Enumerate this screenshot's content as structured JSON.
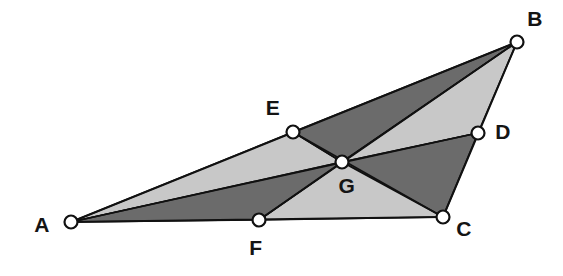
{
  "figure": {
    "kind": "geometry-diagram",
    "width": 563,
    "height": 276,
    "background_color": "#ffffff",
    "outline_color": "#111111",
    "shade_dark_color": "#6b6b6b",
    "shade_light_color": "#c8c8c8",
    "marker_fill_color": "#ffffff",
    "label_color": "#141414"
  },
  "points": [
    {
      "id": "A",
      "label": "A",
      "x": 71,
      "y": 222,
      "label_x": 42,
      "label_y": 224,
      "role": "triangle-vertex"
    },
    {
      "id": "B",
      "label": "B",
      "x": 517,
      "y": 42,
      "label_x": 535,
      "label_y": 18,
      "role": "triangle-vertex"
    },
    {
      "id": "C",
      "label": "C",
      "x": 443,
      "y": 217,
      "label_x": 464,
      "label_y": 228,
      "role": "triangle-vertex"
    },
    {
      "id": "D",
      "label": "D",
      "x": 478,
      "y": 133,
      "label_x": 503,
      "label_y": 131,
      "role": "side-point-on-BC"
    },
    {
      "id": "E",
      "label": "E",
      "x": 293,
      "y": 132,
      "label_x": 273,
      "label_y": 107,
      "role": "side-point-on-AB"
    },
    {
      "id": "F",
      "label": "F",
      "x": 259,
      "y": 220,
      "label_x": 256,
      "label_y": 247,
      "role": "side-point-on-AC"
    },
    {
      "id": "G",
      "label": "G",
      "x": 342,
      "y": 162,
      "label_x": 347,
      "label_y": 185,
      "role": "cevian-intersection"
    }
  ],
  "regions": [
    {
      "id": "AEG",
      "name": "region-a-e-g",
      "vertices": [
        "A",
        "E",
        "G"
      ],
      "shade": "light",
      "fill": "#c8c8c8"
    },
    {
      "id": "EBG",
      "name": "region-e-b-g",
      "vertices": [
        "E",
        "B",
        "G"
      ],
      "shade": "dark",
      "fill": "#6b6b6b"
    },
    {
      "id": "GBD",
      "name": "region-g-b-d",
      "vertices": [
        "G",
        "B",
        "D"
      ],
      "shade": "light",
      "fill": "#c8c8c8"
    },
    {
      "id": "GDC",
      "name": "region-g-d-c",
      "vertices": [
        "G",
        "D",
        "C"
      ],
      "shade": "dark",
      "fill": "#6b6b6b"
    },
    {
      "id": "GCF",
      "name": "region-g-c-f",
      "vertices": [
        "G",
        "C",
        "F"
      ],
      "shade": "light",
      "fill": "#c8c8c8"
    },
    {
      "id": "AGF",
      "name": "region-a-g-f",
      "vertices": [
        "A",
        "G",
        "F"
      ],
      "shade": "dark",
      "fill": "#6b6b6b"
    }
  ],
  "edges": [
    {
      "id": "AB",
      "name": "side-a-b",
      "from": "A",
      "to": "B",
      "kind": "triangle-side"
    },
    {
      "id": "BC",
      "name": "side-b-c",
      "from": "B",
      "to": "C",
      "kind": "triangle-side"
    },
    {
      "id": "CA",
      "name": "side-c-a",
      "from": "C",
      "to": "A",
      "kind": "triangle-side"
    }
  ],
  "cevians": [
    {
      "id": "AD",
      "name": "cevian-a-d",
      "from": "A",
      "to": "D"
    },
    {
      "id": "BF",
      "name": "cevian-b-f",
      "from": "B",
      "to": "F"
    },
    {
      "id": "CE",
      "name": "cevian-c-e",
      "from": "C",
      "to": "E"
    }
  ],
  "marker_radius": 6.5
}
